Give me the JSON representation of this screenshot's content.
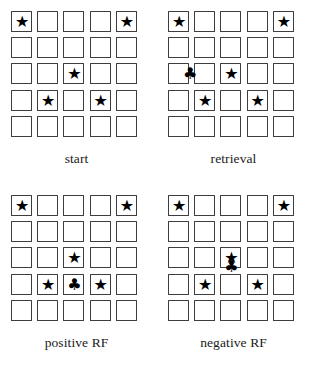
{
  "figure": {
    "type": "grid-diagram",
    "grid_rows": 5,
    "grid_cols": 5,
    "symbols": {
      "star": "★",
      "club": "♣"
    },
    "colors": {
      "cell_border": "#3d3d3d",
      "cell_fill": "#ffffff",
      "symbol": "#000000",
      "background": "#ffffff",
      "caption_text": "#1a1a1a"
    },
    "bottom_cutoff_text": "",
    "panels": [
      {
        "id": "start",
        "caption": "start",
        "stars": [
          {
            "row": 1,
            "col": 1
          },
          {
            "row": 1,
            "col": 5
          },
          {
            "row": 3,
            "col": 3
          },
          {
            "row": 4,
            "col": 2
          },
          {
            "row": 4,
            "col": 4
          }
        ],
        "clubs": []
      },
      {
        "id": "retrieval",
        "caption": "retrieval",
        "stars": [
          {
            "row": 1,
            "col": 1
          },
          {
            "row": 1,
            "col": 5
          },
          {
            "row": 3,
            "col": 3
          },
          {
            "row": 4,
            "col": 2
          },
          {
            "row": 4,
            "col": 4
          }
        ],
        "clubs": [
          {
            "row": 3,
            "col": 1,
            "offset_x": 11,
            "offset_y": 0
          }
        ]
      },
      {
        "id": "positive-rf",
        "caption": "positive RF",
        "stars": [
          {
            "row": 1,
            "col": 1
          },
          {
            "row": 1,
            "col": 5
          },
          {
            "row": 3,
            "col": 3
          },
          {
            "row": 4,
            "col": 2
          },
          {
            "row": 4,
            "col": 4
          }
        ],
        "clubs": [
          {
            "row": 4,
            "col": 3,
            "offset_x": 0,
            "offset_y": 0
          }
        ]
      },
      {
        "id": "negative-rf",
        "caption": "negative RF",
        "stars": [
          {
            "row": 1,
            "col": 1
          },
          {
            "row": 1,
            "col": 5
          },
          {
            "row": 3,
            "col": 3
          },
          {
            "row": 4,
            "col": 2
          },
          {
            "row": 4,
            "col": 4
          }
        ],
        "clubs": [
          {
            "row": 3,
            "col": 3,
            "offset_x": 0,
            "offset_y": 9
          }
        ]
      }
    ]
  }
}
